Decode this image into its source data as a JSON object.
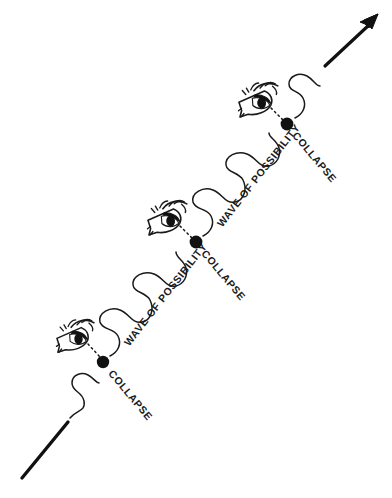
{
  "figure": {
    "background_color": "#ffffff",
    "ink_color": "#1a1a1a",
    "width": 392,
    "height": 498
  },
  "labels": {
    "collapse_1": "COLLAPSE",
    "collapse_2": "COLLAPSE",
    "collapse_3": "COLLAPSE",
    "wave_1": "WAVE OF POSSIBILITY",
    "wave_2": "WAVE OF POSSIBILITY"
  },
  "stages": [
    {
      "index": 1,
      "collapse_label": "COLLAPSE",
      "dot_x": 103,
      "dot_y": 362,
      "observer": "eye-icon",
      "sightline": "dashed"
    },
    {
      "index": 2,
      "collapse_label": "COLLAPSE",
      "dot_x": 196,
      "dot_y": 242,
      "observer": "eye-icon",
      "sightline": "dashed"
    },
    {
      "index": 3,
      "collapse_label": "COLLAPSE",
      "dot_x": 287,
      "dot_y": 124,
      "observer": "eye-icon",
      "sightline": "dashed"
    }
  ],
  "wave_segments": [
    {
      "index": 0,
      "label": ""
    },
    {
      "index": 1,
      "label": "WAVE OF POSSIBILITY"
    },
    {
      "index": 2,
      "label": "WAVE OF POSSIBILITY"
    },
    {
      "index": 3,
      "label": ""
    }
  ],
  "axis": {
    "start_marker": "straight-line-segment",
    "end_marker": "arrow-icon",
    "direction": "lower-left to upper-right"
  }
}
